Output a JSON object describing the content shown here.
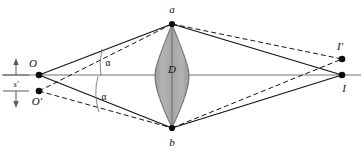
{
  "figure": {
    "background_color": "#ffffff",
    "line_color": "#1a1a1a",
    "axis_color": "#707070",
    "lens_fill": "#a8a8a8",
    "lens_stroke": "#4a4a4a"
  },
  "labels": {
    "top_vertex": "a",
    "bottom_vertex": "b",
    "lens_diameter": "D",
    "object_primary": "O",
    "object_secondary": "O'",
    "image_primary": "I",
    "image_secondary": "I'",
    "angle_upper": "α",
    "angle_lower": "α",
    "separation": "s'"
  },
  "geometry": {
    "axis": {
      "x1": 2,
      "y1": 75,
      "x2": 361,
      "y2": 75
    },
    "points": {
      "a": {
        "x": 172,
        "y": 24
      },
      "b": {
        "x": 172,
        "y": 128
      },
      "O": {
        "x": 39,
        "y": 75
      },
      "Op": {
        "x": 39,
        "y": 91
      },
      "I": {
        "x": 342,
        "y": 75
      },
      "Ip": {
        "x": 342,
        "y": 59
      }
    },
    "lens": {
      "center_x": 172,
      "top_y": 24,
      "bottom_y": 128,
      "half_width": 17
    },
    "dimension_marker": {
      "x": 16,
      "tick_top_y": 75,
      "tick_bottom_y": 91,
      "arrow_top_y": 60,
      "arrow_bottom_y": 106,
      "tick_half_len": 13
    },
    "angle_arcs": {
      "upper": {
        "cx": 39,
        "cy": 75,
        "r": 65,
        "start_deg": -38,
        "end_deg": -13
      },
      "lower": {
        "cx": 39,
        "cy": 91,
        "r": 62,
        "start_deg": 12,
        "end_deg": 36
      }
    }
  },
  "rays": {
    "solid": [
      {
        "name": "O-to-a",
        "from": "O",
        "to": "a"
      },
      {
        "name": "O-to-b",
        "from": "O",
        "to": "b"
      },
      {
        "name": "a-to-I",
        "from": "a",
        "to": "I"
      },
      {
        "name": "b-to-I",
        "from": "b",
        "to": "I"
      }
    ],
    "dashed": [
      {
        "name": "Op-to-a",
        "from": "Op",
        "to": "a"
      },
      {
        "name": "Op-to-b",
        "from": "Op",
        "to": "b"
      },
      {
        "name": "a-to-Ip",
        "from": "a",
        "to": "Ip"
      },
      {
        "name": "b-to-Ip",
        "from": "b",
        "to": "Ip"
      }
    ]
  },
  "label_positions": {
    "a": {
      "x": 172,
      "y": 13,
      "anchor": "middle"
    },
    "b": {
      "x": 172,
      "y": 145,
      "anchor": "middle"
    },
    "D": {
      "x": 172,
      "y": 73,
      "anchor": "middle"
    },
    "O": {
      "x": 33,
      "y": 66,
      "anchor": "middle"
    },
    "Op": {
      "x": 36,
      "y": 104,
      "anchor": "middle"
    },
    "I": {
      "x": 343,
      "y": 91,
      "anchor": "middle"
    },
    "Ip": {
      "x": 340,
      "y": 49,
      "anchor": "middle"
    },
    "alpha_upper": {
      "x": 107,
      "y": 63,
      "anchor": "middle"
    },
    "alpha_lower": {
      "x": 103,
      "y": 97,
      "anchor": "middle"
    },
    "s": {
      "x": 16,
      "y": 87,
      "anchor": "middle"
    }
  }
}
